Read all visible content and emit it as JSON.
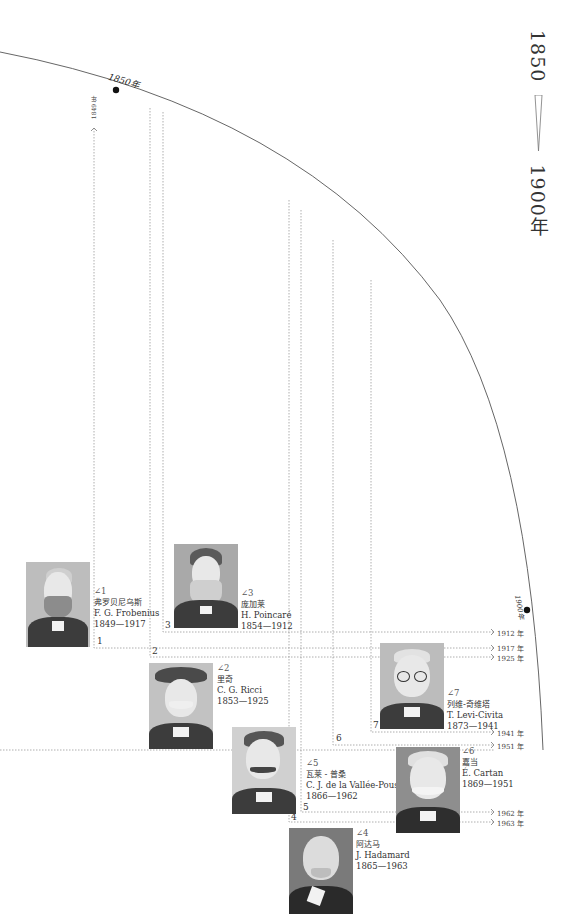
{
  "title": {
    "start": "1850",
    "end": "1900年"
  },
  "arc_marks": [
    {
      "label": "1850年"
    },
    {
      "label": "1900年"
    }
  ],
  "start_marker": {
    "label": "1849 年"
  },
  "end_years": [
    "1912 年",
    "1917 年",
    "1925 年",
    "1941 年",
    "1951 年",
    "1962 年",
    "1963 年"
  ],
  "people": [
    {
      "num": "1",
      "angle": "∠1",
      "name_cn": "弗罗贝尼乌斯",
      "name_en": "F. G. Frobenius",
      "years": "1849—1917"
    },
    {
      "num": "2",
      "angle": "∠2",
      "name_cn": "里奇",
      "name_en": "C. G. Ricci",
      "years": "1853—1925"
    },
    {
      "num": "3",
      "angle": "∠3",
      "name_cn": "庞加莱",
      "name_en": "H. Poincaré",
      "years": "1854—1912"
    },
    {
      "num": "4",
      "angle": "∠4",
      "name_cn": "阿达马",
      "name_en": "J. Hadamard",
      "years": "1865—1963"
    },
    {
      "num": "5",
      "angle": "∠5",
      "name_cn": "瓦莱 - 普桑",
      "name_en": "C. J. de la Vallée-Poussin",
      "years": "1866—1962"
    },
    {
      "num": "6",
      "angle": "∠6",
      "name_cn": "嘉当",
      "name_en": "É. Cartan",
      "years": "1869—1951"
    },
    {
      "num": "7",
      "angle": "∠7",
      "name_cn": "列维-奇维塔",
      "name_en": "T. Levi-Civita",
      "years": "1873—1941"
    }
  ],
  "colors": {
    "arc": "#555555",
    "dotted": "#9a9a9a",
    "text": "#2a2a2a"
  }
}
